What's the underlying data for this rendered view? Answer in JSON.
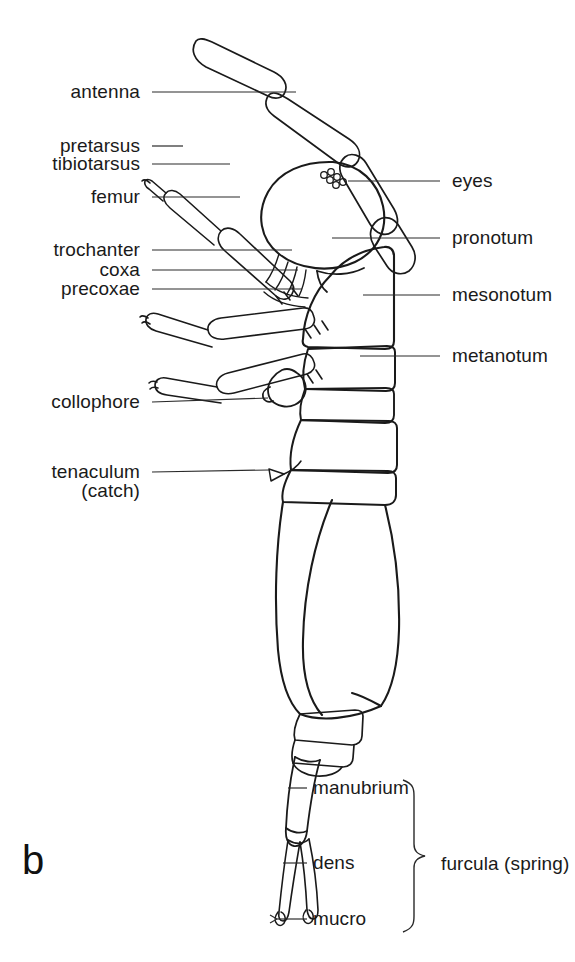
{
  "figure": {
    "panel_letter": "b",
    "background_color": "#ffffff",
    "ink_color": "#1a1a1a"
  },
  "labels_left": [
    {
      "id": "antenna",
      "text": "antenna",
      "x": 140,
      "y": 81,
      "leader": {
        "x1": 152,
        "y1": 92,
        "x2": 296,
        "y2": 92
      }
    },
    {
      "id": "pretarsus",
      "text": "pretarsus",
      "x": 140,
      "y": 135,
      "leader": {
        "x1": 152,
        "y1": 146,
        "x2": 183,
        "y2": 146
      }
    },
    {
      "id": "tibiotarsus",
      "text": "tibiotarsus",
      "x": 140,
      "y": 153,
      "leader": {
        "x1": 152,
        "y1": 164,
        "x2": 230,
        "y2": 164
      }
    },
    {
      "id": "femur",
      "text": "femur",
      "x": 140,
      "y": 186,
      "leader": {
        "x1": 152,
        "y1": 197,
        "x2": 240,
        "y2": 197
      }
    },
    {
      "id": "trochanter",
      "text": "trochanter",
      "x": 140,
      "y": 239,
      "leader": {
        "x1": 152,
        "y1": 250,
        "x2": 292,
        "y2": 250
      }
    },
    {
      "id": "coxa",
      "text": "coxa",
      "x": 140,
      "y": 259,
      "leader": {
        "x1": 152,
        "y1": 270,
        "x2": 298,
        "y2": 270
      }
    },
    {
      "id": "precoxae",
      "text": "precoxae",
      "x": 140,
      "y": 278,
      "leader": {
        "x1": 152,
        "y1": 289,
        "x2": 302,
        "y2": 289
      }
    },
    {
      "id": "collophore",
      "text": "collophore",
      "x": 140,
      "y": 391,
      "leader": {
        "x1": 152,
        "y1": 402,
        "x2": 268,
        "y2": 398
      }
    },
    {
      "id": "tenaculum",
      "text": "tenaculum",
      "x": 140,
      "y": 461,
      "leader": {
        "x1": 152,
        "y1": 472,
        "x2": 269,
        "y2": 470
      }
    },
    {
      "id": "catch",
      "text": "(catch)",
      "x": 140,
      "y": 480,
      "leader": null
    }
  ],
  "labels_right": [
    {
      "id": "eyes",
      "text": "eyes",
      "x": 452,
      "y": 170,
      "leader": {
        "x1": 348,
        "y1": 181,
        "x2": 440,
        "y2": 181
      }
    },
    {
      "id": "pronotum",
      "text": "pronotum",
      "x": 452,
      "y": 227,
      "leader": {
        "x1": 332,
        "y1": 238,
        "x2": 440,
        "y2": 238
      }
    },
    {
      "id": "mesonotum",
      "text": "mesonotum",
      "x": 452,
      "y": 284,
      "leader": {
        "x1": 363,
        "y1": 295,
        "x2": 440,
        "y2": 295
      }
    },
    {
      "id": "metanotum",
      "text": "metanotum",
      "x": 452,
      "y": 345,
      "leader": {
        "x1": 360,
        "y1": 356,
        "x2": 440,
        "y2": 356
      }
    }
  ],
  "labels_furcula": [
    {
      "id": "manubrium",
      "text": "manubrium",
      "x": 313,
      "y": 777,
      "leader": {
        "x1": 288,
        "y1": 788,
        "x2": 307,
        "y2": 788
      }
    },
    {
      "id": "dens",
      "text": "dens",
      "x": 313,
      "y": 852,
      "leader": {
        "x1": 283,
        "y1": 863,
        "x2": 307,
        "y2": 863
      }
    },
    {
      "id": "mucro",
      "text": "mucro",
      "x": 313,
      "y": 908,
      "leader": {
        "x1": 277,
        "y1": 919,
        "x2": 307,
        "y2": 919
      },
      "arrow": true
    }
  ],
  "bracket_group": {
    "id": "furcula-group",
    "label": "furcula (spring)",
    "label_x": 441,
    "label_y": 853,
    "brace_top_y": 780,
    "brace_bottom_y": 932,
    "brace_x": 414
  }
}
